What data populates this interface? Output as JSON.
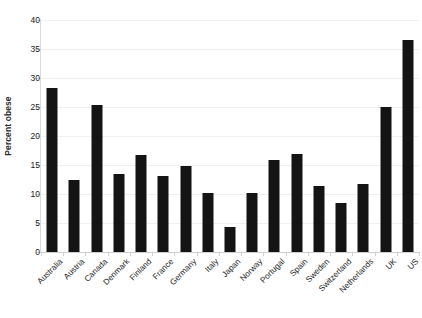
{
  "chart_data": {
    "type": "bar",
    "title": "",
    "xlabel": "",
    "ylabel": "Percent obese",
    "ylim": [
      0,
      40
    ],
    "yticks": [
      0,
      5,
      10,
      15,
      20,
      25,
      30,
      35,
      40
    ],
    "ytick_labels": [
      "0",
      "5",
      "10",
      "15",
      "20",
      "25",
      "30",
      "35",
      "40"
    ],
    "grid": true,
    "legend": null,
    "bar_color": "#141414",
    "axis_color": "#d9d9d9",
    "gridline_color": "#f0f0f0",
    "categories": [
      "Australia",
      "Austria",
      "Canada",
      "Denmark",
      "Finland",
      "France",
      "Germany",
      "Italy",
      "Japan",
      "Norway",
      "Portugal",
      "Spain",
      "Sweden",
      "Switzerland",
      "Netherlands",
      "UK",
      "US"
    ],
    "values": [
      28.3,
      12.4,
      25.4,
      13.4,
      16.8,
      13.1,
      14.9,
      10.2,
      4.3,
      10.2,
      15.8,
      16.9,
      11.4,
      8.4,
      11.8,
      25.0,
      36.5
    ]
  }
}
